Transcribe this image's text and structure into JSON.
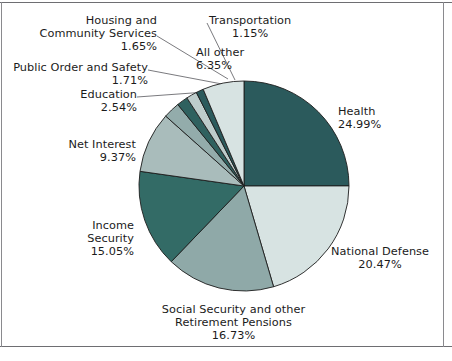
{
  "chart_data": {
    "type": "pie",
    "title": "",
    "subtitle": "",
    "xlabel": "",
    "ylabel": "",
    "legend_position": "callout-labels",
    "grid": false,
    "units": "percent",
    "start_angle_deg": 0,
    "direction": "clockwise",
    "categories": [
      "Health",
      "National Defense",
      "Social Security and other Retirement Pensions",
      "Income Security",
      "Net Interest",
      "Education",
      "Public Order and Safety",
      "Housing and Community Services",
      "Transportation",
      "All other"
    ],
    "values": [
      24.99,
      20.47,
      16.73,
      15.05,
      9.37,
      2.54,
      1.71,
      1.65,
      1.15,
      6.35
    ],
    "colors": [
      "#2b5a5c",
      "#d7e3e2",
      "#8fa9a8",
      "#336b66",
      "#a9bcbb",
      "#93acab",
      "#2f615f",
      "#bdcccb",
      "#2b5a5c",
      "#d7e3e2"
    ]
  },
  "slices": [
    {
      "name": "Health",
      "percent": "24.99%",
      "label_lines": [
        "Health",
        "24.99%"
      ],
      "color": "#2b5a5c"
    },
    {
      "name": "National Defense",
      "percent": "20.47%",
      "label_lines": [
        "National Defense",
        "20.47%"
      ],
      "color": "#d7e3e2"
    },
    {
      "name": "Social Security and other Retirement Pensions",
      "percent": "16.73%",
      "label_lines": [
        "Social Security and other",
        "Retirement Pensions",
        "16.73%"
      ],
      "color": "#8fa9a8"
    },
    {
      "name": "Income Security",
      "percent": "15.05%",
      "label_lines": [
        "Income",
        "Security",
        "15.05%"
      ],
      "color": "#336b66"
    },
    {
      "name": "Net Interest",
      "percent": "9.37%",
      "label_lines": [
        "Net Interest",
        "9.37%"
      ],
      "color": "#a9bcbb"
    },
    {
      "name": "Education",
      "percent": "2.54%",
      "label_lines": [
        "Education",
        "2.54%"
      ],
      "color": "#93acab"
    },
    {
      "name": "Public Order and Safety",
      "percent": "1.71%",
      "label_lines": [
        "Public Order and Safety",
        "1.71%"
      ],
      "color": "#2f615f"
    },
    {
      "name": "Housing and Community Services",
      "percent": "1.65%",
      "label_lines": [
        "Housing and",
        "Community Services",
        "1.65%"
      ],
      "color": "#bdcccb"
    },
    {
      "name": "Transportation",
      "percent": "1.15%",
      "label_lines": [
        "Transportation",
        "1.15%"
      ],
      "color": "#2b5a5c"
    },
    {
      "name": "All other",
      "percent": "6.35%",
      "label_lines": [
        "All other",
        "6.35%"
      ],
      "color": "#d7e3e2"
    }
  ],
  "labels": {
    "health": {
      "l1": "Health",
      "l2": "24.99%"
    },
    "national_defense": {
      "l1": "National Defense",
      "l2": "20.47%"
    },
    "social_security": {
      "l1": "Social Security and other",
      "l2": "Retirement Pensions",
      "l3": "16.73%"
    },
    "income_security": {
      "l1": "Income",
      "l2": "Security",
      "l3": "15.05%"
    },
    "net_interest": {
      "l1": "Net Interest",
      "l2": "9.37%"
    },
    "education": {
      "l1": "Education",
      "l2": "2.54%"
    },
    "public_order": {
      "l1": "Public Order and Safety",
      "l2": "1.71%"
    },
    "housing": {
      "l1": "Housing and",
      "l2": "Community Services",
      "l3": "1.65%"
    },
    "transportation": {
      "l1": "Transportation",
      "l2": "1.15%"
    },
    "all_other": {
      "l1": "All other",
      "l2": "6.35%"
    }
  },
  "geometry": {
    "center_x": 244,
    "center_y": 186,
    "radius": 105
  },
  "style": {
    "slice_stroke": "#1d1d1d",
    "leader_line_color": "#6b6b6f",
    "frame_color": "#6e6e72",
    "text_color": "#1b1b1b",
    "background": "#ffffff"
  }
}
